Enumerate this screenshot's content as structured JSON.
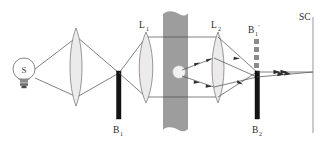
{
  "figure": {
    "background_color": "#ffffff",
    "width": 329,
    "height": 143
  },
  "colors": {
    "ray": "#4a4a4a",
    "lens_fill": "#eceaea",
    "lens_stroke": "#6e6e6e",
    "slab_gray": "#9d9d9d",
    "bar_dark": "#141414",
    "bar_dotted": "#8a8a8a",
    "screen": "#8d8d8d",
    "text": "#2b2b2b",
    "spot": "#f2f2f2"
  },
  "components": {
    "source": {
      "label": "S",
      "name": "light-source-bulb",
      "description": "light bulb with letter S inside the glass envelope"
    },
    "condenser_lens": {
      "label": "",
      "name": "condenser-lens",
      "description": "unlabeled biconvex condenser lens after the source"
    },
    "lens1": {
      "label": "L",
      "subscript": "1",
      "name": "lens-L1",
      "description": "first collimating biconvex lens"
    },
    "lens2": {
      "label": "L",
      "subscript": "2",
      "name": "lens-L2",
      "description": "second focusing biconvex lens"
    },
    "stop1": {
      "label": "B",
      "subscript": "1",
      "name": "stop-B1",
      "description": "opaque vertical knife-edge / stop at the first focal plane"
    },
    "stop1_image": {
      "label": "B",
      "subscript": "1",
      "prime": "'",
      "name": "stop-B1-prime",
      "description": "dotted gray bar: image of stop B1"
    },
    "stop2": {
      "label": "B",
      "subscript": "2",
      "name": "stop-B2",
      "description": "opaque vertical knife-edge / stop after lens L2"
    },
    "test_section": {
      "label": "",
      "name": "test-section-slab",
      "description": "gray vertical slab (test object / medium) with torn wavy top and bottom edges"
    },
    "scatter_point": {
      "label": "",
      "name": "scattering-point",
      "description": "bright circular scattering point inside the gray slab"
    },
    "screen": {
      "label": "SC",
      "name": "screen-SC",
      "description": "observation screen at the far right"
    }
  },
  "labels": [
    {
      "id": "S",
      "text": "S",
      "sub": "",
      "prime": ""
    },
    {
      "id": "L1",
      "text": "L",
      "sub": "1",
      "prime": ""
    },
    {
      "id": "L2",
      "text": "L",
      "sub": "2",
      "prime": ""
    },
    {
      "id": "B1",
      "text": "B",
      "sub": "1",
      "prime": ""
    },
    {
      "id": "B1prime",
      "text": "B",
      "sub": "1",
      "prime": "'"
    },
    {
      "id": "B2",
      "text": "B",
      "sub": "2",
      "prime": ""
    },
    {
      "id": "SC",
      "text": "SC",
      "sub": "",
      "prime": ""
    }
  ],
  "rays": {
    "description": "Light from S is condensed, crosses at stop B1, is collimated by L1 through the gray test slab, scatters at the bright point, is refocused by L2 onto stop B2, and the emerging beams travel to screen SC",
    "arrow_count_right_of_B2": 4
  }
}
